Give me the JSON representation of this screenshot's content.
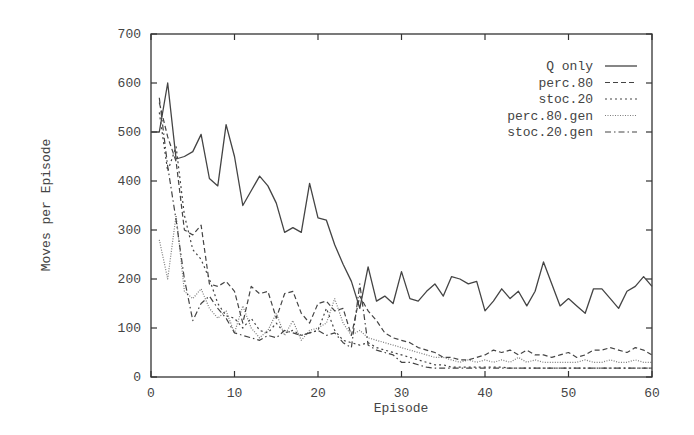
{
  "chart_data": {
    "type": "line",
    "title": "",
    "xlabel": "Episode",
    "ylabel": "Moves per Episode",
    "xlim": [
      0,
      60
    ],
    "ylim": [
      0,
      700
    ],
    "xticks": [
      0,
      10,
      20,
      30,
      40,
      50,
      60
    ],
    "yticks": [
      0,
      100,
      200,
      300,
      400,
      500,
      600,
      700
    ],
    "grid": false,
    "legend_position": "upper right",
    "x": [
      0,
      1,
      2,
      3,
      4,
      5,
      6,
      7,
      8,
      9,
      10,
      11,
      12,
      13,
      14,
      15,
      16,
      17,
      18,
      19,
      20,
      21,
      22,
      23,
      24,
      25,
      26,
      27,
      28,
      29,
      30,
      31,
      32,
      33,
      34,
      35,
      36,
      37,
      38,
      39,
      40,
      41,
      42,
      43,
      44,
      45,
      46,
      47,
      48,
      49,
      50,
      51,
      52,
      53,
      54,
      55,
      56,
      57,
      58,
      59,
      60
    ],
    "series": [
      {
        "name": "Q only",
        "style": "solid",
        "x": [
          0,
          1,
          2,
          3,
          4,
          5,
          6,
          7,
          8,
          9,
          10,
          11,
          12,
          13,
          14,
          15,
          16,
          17,
          18,
          19,
          20,
          21,
          22,
          23,
          24,
          25,
          26,
          27,
          28,
          29,
          30,
          31,
          32,
          33,
          34,
          35,
          36,
          37,
          38,
          39,
          40,
          41,
          42,
          43,
          44,
          45,
          46,
          47,
          48,
          49,
          50,
          51,
          52,
          53,
          54,
          55,
          56,
          57,
          58,
          59,
          60
        ],
        "values": [
          500,
          500,
          600,
          445,
          450,
          460,
          495,
          405,
          390,
          515,
          450,
          350,
          380,
          410,
          390,
          355,
          295,
          305,
          295,
          395,
          325,
          320,
          270,
          230,
          195,
          140,
          225,
          155,
          165,
          150,
          215,
          160,
          155,
          175,
          190,
          165,
          205,
          200,
          190,
          195,
          135,
          155,
          180,
          160,
          175,
          145,
          175,
          235,
          190,
          145,
          160,
          145,
          130,
          180,
          180,
          160,
          140,
          175,
          185,
          205,
          185
        ]
      },
      {
        "name": "perc.80",
        "style": "dashed",
        "x": [
          1,
          2,
          3,
          4,
          5,
          6,
          7,
          8,
          9,
          10,
          11,
          12,
          13,
          14,
          15,
          16,
          17,
          18,
          19,
          20,
          21,
          22,
          23,
          24,
          25,
          26,
          27,
          28,
          29,
          30,
          31,
          32,
          33,
          34,
          35,
          36,
          37,
          38,
          39,
          40,
          41,
          42,
          43,
          44,
          45,
          46,
          47,
          48,
          49,
          50,
          51,
          52,
          53,
          54,
          55,
          56,
          57,
          58,
          59,
          60
        ],
        "values": [
          560,
          490,
          440,
          300,
          290,
          310,
          190,
          185,
          195,
          175,
          110,
          185,
          170,
          175,
          120,
          170,
          175,
          130,
          110,
          150,
          155,
          135,
          140,
          85,
          165,
          135,
          115,
          90,
          80,
          75,
          70,
          60,
          55,
          50,
          40,
          40,
          35,
          35,
          40,
          45,
          55,
          50,
          55,
          45,
          55,
          45,
          45,
          40,
          45,
          50,
          40,
          45,
          55,
          55,
          60,
          55,
          50,
          60,
          55,
          45
        ]
      },
      {
        "name": "stoc.20",
        "style": "dotted-coarse",
        "x": [
          1,
          2,
          3,
          4,
          5,
          6,
          7,
          8,
          9,
          10,
          11,
          12,
          13,
          14,
          15,
          16,
          17,
          18,
          19,
          20,
          21,
          22,
          23,
          24,
          25,
          26,
          27,
          28,
          29,
          30,
          31,
          32,
          33,
          34,
          35,
          36,
          37,
          38,
          39,
          40,
          41,
          42,
          43,
          44,
          45,
          46,
          47,
          48,
          49,
          50,
          51,
          52,
          53,
          54,
          55,
          56,
          57,
          58,
          59,
          60
        ],
        "values": [
          540,
          420,
          470,
          330,
          260,
          240,
          200,
          150,
          125,
          120,
          100,
          120,
          95,
          90,
          110,
          90,
          95,
          85,
          90,
          95,
          140,
          95,
          75,
          70,
          65,
          70,
          60,
          55,
          50,
          45,
          40,
          35,
          30,
          25,
          25,
          20,
          20,
          20,
          20,
          20,
          20,
          20,
          18,
          18,
          18,
          18,
          18,
          18,
          18,
          18,
          18,
          18,
          18,
          18,
          18,
          18,
          18,
          18,
          18,
          18
        ]
      },
      {
        "name": "perc.80.gen",
        "style": "dotted-fine",
        "x": [
          1,
          2,
          3,
          4,
          5,
          6,
          7,
          8,
          9,
          10,
          11,
          12,
          13,
          14,
          15,
          16,
          17,
          18,
          19,
          20,
          21,
          22,
          23,
          24,
          25,
          26,
          27,
          28,
          29,
          30,
          31,
          32,
          33,
          34,
          35,
          36,
          37,
          38,
          39,
          40,
          41,
          42,
          43,
          44,
          45,
          46,
          47,
          48,
          49,
          50,
          51,
          52,
          53,
          54,
          55,
          56,
          57,
          58,
          59,
          60
        ],
        "values": [
          280,
          200,
          330,
          175,
          160,
          180,
          140,
          120,
          135,
          90,
          145,
          100,
          80,
          95,
          130,
          85,
          115,
          75,
          95,
          100,
          110,
          160,
          110,
          85,
          95,
          80,
          75,
          70,
          65,
          60,
          55,
          50,
          45,
          40,
          40,
          35,
          30,
          35,
          30,
          35,
          30,
          35,
          30,
          40,
          30,
          35,
          30,
          30,
          30,
          30,
          30,
          35,
          30,
          30,
          35,
          30,
          30,
          35,
          30,
          30
        ]
      },
      {
        "name": "stoc.20.gen",
        "style": "dash-dot",
        "x": [
          1,
          2,
          3,
          4,
          5,
          6,
          7,
          8,
          9,
          10,
          11,
          12,
          13,
          14,
          15,
          16,
          17,
          18,
          19,
          20,
          21,
          22,
          23,
          24,
          25,
          26,
          27,
          28,
          29,
          30,
          31,
          32,
          33,
          34,
          35,
          36,
          37,
          38,
          39,
          40,
          41,
          42,
          43,
          44,
          45,
          46,
          47,
          48,
          49,
          50,
          51,
          52,
          53,
          54,
          55,
          56,
          57,
          58,
          59,
          60
        ],
        "values": [
          570,
          430,
          320,
          200,
          115,
          150,
          165,
          140,
          120,
          90,
          85,
          80,
          75,
          85,
          80,
          95,
          90,
          85,
          90,
          95,
          85,
          90,
          70,
          60,
          190,
          65,
          55,
          50,
          45,
          30,
          30,
          25,
          20,
          18,
          18,
          18,
          18,
          18,
          18,
          18,
          18,
          18,
          18,
          18,
          18,
          18,
          18,
          18,
          18,
          18,
          18,
          18,
          18,
          18,
          18,
          18,
          18,
          18,
          18,
          18
        ]
      }
    ]
  },
  "legend": {
    "items": [
      {
        "label": "Q only"
      },
      {
        "label": "perc.80"
      },
      {
        "label": "stoc.20"
      },
      {
        "label": "perc.80.gen"
      },
      {
        "label": "stoc.20.gen"
      }
    ]
  },
  "axes": {
    "xlabel": "Episode",
    "ylabel": "Moves per Episode",
    "xtick_labels": [
      "0",
      "10",
      "20",
      "30",
      "40",
      "50",
      "60"
    ],
    "ytick_labels": [
      "0",
      "100",
      "200",
      "300",
      "400",
      "500",
      "600",
      "700"
    ]
  },
  "colors": {
    "line": "#444444",
    "frame": "#333333",
    "background": "#ffffff"
  }
}
